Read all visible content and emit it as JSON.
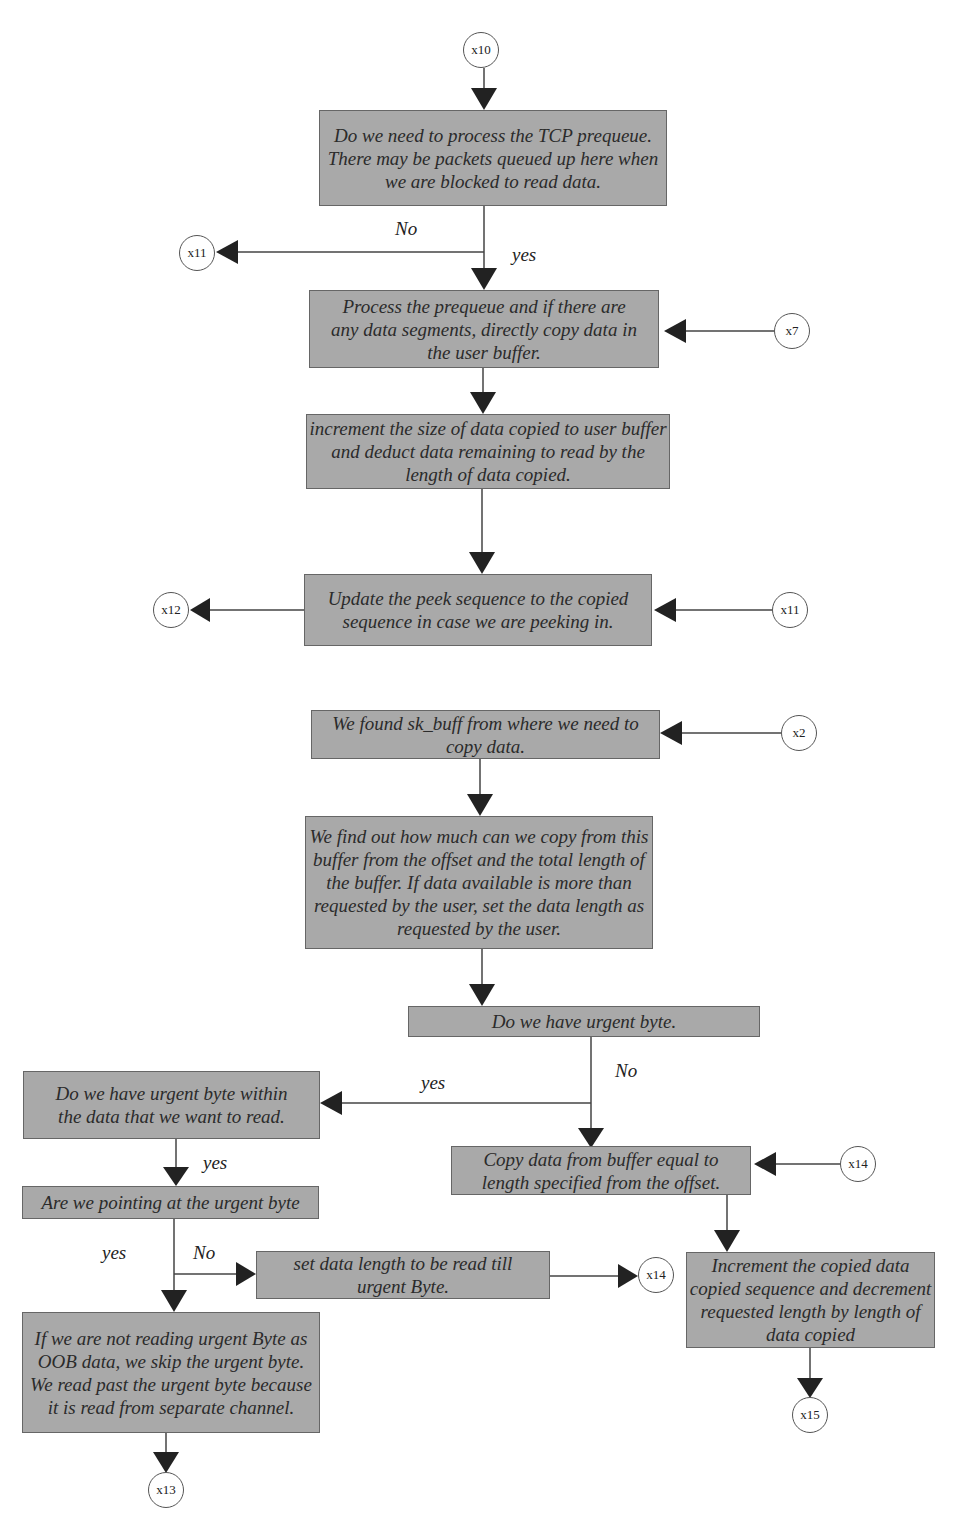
{
  "diagram": {
    "type": "flowchart",
    "connectors": [
      "x10",
      "x11",
      "x7",
      "x12",
      "x11",
      "x2",
      "x14",
      "x14",
      "x13",
      "x15"
    ],
    "boxes": {
      "process_prequeue_q": "Do we need to process the TCP prequeue. There may be packets queued up here when we are blocked to read data.",
      "process_prequeue": "Process the prequeue and if there are any data segments, directly copy data in the user buffer.",
      "increment_size": "increment the size of data copied to user buffer and deduct data remaining to read by the length of data copied.",
      "update_peek": "Update the peek sequence to the copied sequence in case we are peeking in.",
      "found_skbuff": "We found sk_buff from where we need to copy data.",
      "find_copy_len": "We find out how much can we copy from this buffer from the offset and the total length of the buffer. If data available is more than requested by the user, set the data length as requested by the user.",
      "urgent_q": "Do we have urgent byte.",
      "urgent_within_q": "Do we have urgent byte within the data that we want to read.",
      "pointing_urgent_q": "Are we pointing at the urgent byte",
      "skip_urgent": "If we are not reading urgent Byte as OOB data, we skip the urgent byte. We read past the urgent byte because it is read from separate channel.",
      "set_len_till_urgent": "set data length to be read till urgent Byte.",
      "copy_data": "Copy data from buffer equal to length specified from the offset.",
      "increment_copied": "Increment the copied data copied sequence and decrement requested length by length of data copied"
    },
    "nodes": {
      "x10": "x10",
      "x11_left": "x11",
      "x7": "x7",
      "x12": "x12",
      "x11_right": "x11",
      "x2": "x2",
      "x14_right": "x14",
      "x14_mid": "x14",
      "x13": "x13",
      "x15": "x15"
    },
    "labels": {
      "no_1": "No",
      "yes_1": "yes",
      "no_2": "No",
      "yes_2": "yes",
      "yes_3": "yes",
      "yes_4": "yes",
      "no_4": "No"
    },
    "colors": {
      "box_fill": "#a9a9a9",
      "box_border": "#666666",
      "line": "#444444",
      "arrow": "#222222"
    }
  }
}
